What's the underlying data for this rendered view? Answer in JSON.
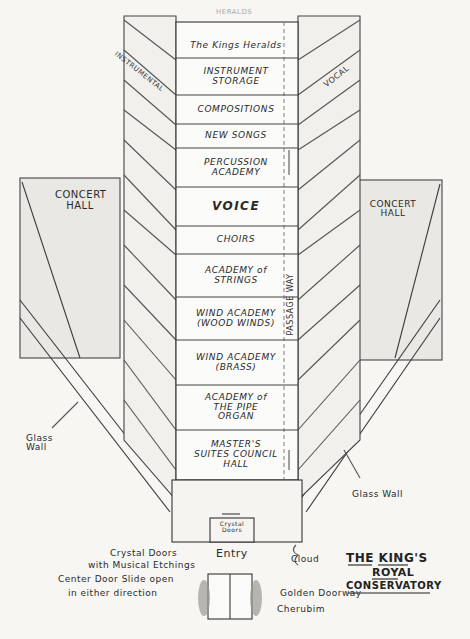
{
  "title": {
    "line1": "THE KING'S",
    "line2": "ROYAL",
    "line3": "CONSERVATORY"
  },
  "tower": {
    "top_faint": "HERALDS",
    "rooms": [
      {
        "label": "The Kings Heralds"
      },
      {
        "label": "INSTRUMENT STORAGE"
      },
      {
        "label": "COMPOSITIONS"
      },
      {
        "label": "NEW SONGS"
      },
      {
        "label": "PERCUSSION ACADEMY"
      },
      {
        "label": "VOICE"
      },
      {
        "label": "CHOIRS"
      },
      {
        "label": "ACADEMY of STRINGS"
      },
      {
        "label": "WIND ACADEMY (WOOD WINDS)"
      },
      {
        "label": "WIND ACADEMY (BRASS)"
      },
      {
        "label": "ACADEMY of THE PIPE ORGAN"
      },
      {
        "label": "MASTER'S SUITES COUNCIL HALL"
      }
    ],
    "left_wing": "INSTRUMENTAL",
    "right_wing": "VOCAL",
    "passage": "PASSAGE WAY"
  },
  "halls": {
    "left": "CONCERT HALL",
    "right": "CONCERT HALL"
  },
  "walls": {
    "left": "Glass Wall",
    "right": "Glass Wall"
  },
  "entry": {
    "crystal_doors_box": "Crystal Doors",
    "entry_label": "Entry",
    "note_line1": "Crystal Doors",
    "note_line2": "with Musical Etchings",
    "note_line3": "Center Door Slide open",
    "note_line4": "in either direction",
    "cloud": "Cloud",
    "golden_doorway": "Golden Doorway",
    "cherubim": "Cherubim"
  }
}
